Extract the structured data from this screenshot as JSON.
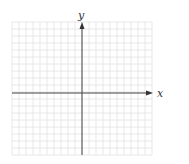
{
  "diagram": {
    "type": "coordinate-grid",
    "x_axis_label": "x",
    "y_axis_label": "y",
    "grid": {
      "columns": 20,
      "rows": 19,
      "cell_px": 7
    },
    "colors": {
      "grid": "#e2e2e2",
      "axis": "#444444",
      "label": "#333333",
      "background": "#ffffff"
    }
  },
  "chart_data": {
    "type": "scatter",
    "title": "",
    "xlabel": "x",
    "ylabel": "y",
    "series": [],
    "grid": true,
    "note": "Empty Cartesian coordinate grid with no tick labels"
  }
}
